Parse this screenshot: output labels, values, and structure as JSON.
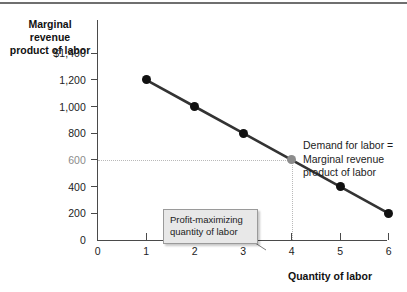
{
  "chart_data": {
    "type": "line",
    "title": "",
    "xlabel": "Quantity of labor",
    "ylabel": "Marginal revenue product of labor",
    "x": [
      1,
      2,
      3,
      4,
      5,
      6
    ],
    "values": [
      1200,
      1000,
      800,
      600,
      400,
      200
    ],
    "series": [
      {
        "name": "Demand for labor = Marginal revenue product of labor",
        "values": [
          1200,
          1000,
          800,
          600,
          400,
          200
        ]
      }
    ],
    "xlim": [
      0,
      6.5
    ],
    "ylim": [
      0,
      1500
    ],
    "x_ticks": [
      "0",
      "1",
      "2",
      "3",
      "4",
      "5",
      "6"
    ],
    "y_ticks": [
      "$1,400",
      "1,200",
      "1,000",
      "800",
      "600",
      "400",
      "200",
      "0"
    ],
    "grid": false,
    "legend": "none",
    "annotations": [
      {
        "name": "curve-label",
        "text": "Demand for labor = Marginal revenue product of labor",
        "lines": [
          "Demand for labor =",
          "Marginal revenue",
          "product of labor"
        ]
      },
      {
        "name": "callout",
        "text": "Profit-maximizing quantity of labor",
        "lines": [
          "Profit-maximizing",
          "quantity of labor"
        ],
        "points_to_x": 4
      }
    ],
    "highlight_point": {
      "x": 4,
      "y": 600,
      "color": "#8c8c8c"
    },
    "guides": {
      "y_value": 600,
      "x_value": 4,
      "style": "dotted"
    }
  },
  "axes": {
    "y_title_lines": [
      "Marginal revenue",
      "product of labor"
    ],
    "x_title": "Quantity of labor",
    "y_ticks": [
      {
        "label": "$1,400",
        "value": 1400,
        "muted": false
      },
      {
        "label": "1,200",
        "value": 1200,
        "muted": false
      },
      {
        "label": "1,000",
        "value": 1000,
        "muted": false
      },
      {
        "label": "800",
        "value": 800,
        "muted": false
      },
      {
        "label": "600",
        "value": 600,
        "muted": true
      },
      {
        "label": "400",
        "value": 400,
        "muted": false
      },
      {
        "label": "200",
        "value": 200,
        "muted": false
      },
      {
        "label": "0",
        "value": 0,
        "muted": false
      }
    ],
    "x_ticks": [
      {
        "label": "0",
        "value": 0
      },
      {
        "label": "1",
        "value": 1
      },
      {
        "label": "2",
        "value": 2
      },
      {
        "label": "3",
        "value": 3
      },
      {
        "label": "4",
        "value": 4
      },
      {
        "label": "5",
        "value": 5
      },
      {
        "label": "6",
        "value": 6
      }
    ]
  },
  "labels": {
    "demand_line_1": "Demand for labor =",
    "demand_line_2": "Marginal revenue",
    "demand_line_3": "product of labor",
    "callout_line_1": "Profit-maximizing",
    "callout_line_2": "quantity of labor",
    "y_title_line_1": "Marginal revenue",
    "y_title_line_2": "product of labor",
    "x_title": "Quantity of labor"
  },
  "colors": {
    "curve": "#333333",
    "point": "#111111",
    "highlight_point": "#8c8c8c",
    "axis": "#4a4a4a",
    "guide": "#b9b9b9",
    "callout_bg": "#e8e8e8",
    "callout_border": "#9a9a9a",
    "top_rule": "#6f6f6f",
    "muted_text": "#8b8b8b"
  }
}
